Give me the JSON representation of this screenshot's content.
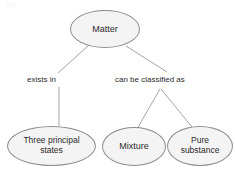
{
  "diagram": {
    "type": "concept-map",
    "colors": {
      "node_fill": "#f4f4f4",
      "node_stroke": "#8c8c8c",
      "text": "#2b2b2b",
      "edge_stroke": "#9a9a9a",
      "background": "#ffffff"
    },
    "nodes": [
      {
        "id": "matter",
        "label": "Matter",
        "shape": "ellipse"
      },
      {
        "id": "three_states",
        "label": "Three principal\nstates",
        "shape": "ellipse"
      },
      {
        "id": "mixture",
        "label": "Mixture",
        "shape": "ellipse"
      },
      {
        "id": "pure_substance",
        "label": "Pure\nsubstance",
        "shape": "ellipse"
      }
    ],
    "edge_labels": [
      {
        "id": "exists_in",
        "label": "exists in"
      },
      {
        "id": "classified_as",
        "label": "can be classified as"
      }
    ],
    "edges": [
      {
        "from": "matter",
        "to": "exists_in"
      },
      {
        "from": "exists_in",
        "to": "three_states"
      },
      {
        "from": "matter",
        "to": "classified_as"
      },
      {
        "from": "classified_as",
        "to": "mixture"
      },
      {
        "from": "classified_as",
        "to": "pure_substance"
      }
    ]
  }
}
